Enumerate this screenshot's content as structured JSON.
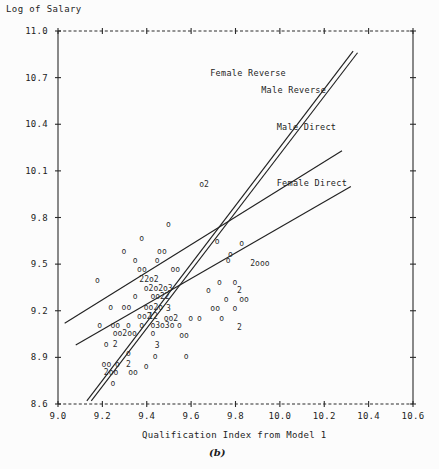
{
  "figure": {
    "panel_label": "(b)",
    "ylabel": "Log of Salary",
    "xlabel": "Qualification Index from Model 1"
  },
  "chart_data": {
    "type": "scatter",
    "title": "",
    "ylabel": "Log of Salary",
    "xlabel": "Qualification Index from Model 1",
    "panel": "(b)",
    "xlim": [
      9.0,
      10.6
    ],
    "ylim": [
      8.6,
      11.0
    ],
    "xticks": [
      "9.0",
      "9.2",
      "9.4",
      "9.6",
      "9.8",
      "10.0",
      "10.2",
      "10.4",
      "10.6"
    ],
    "yticks": [
      "11.0",
      "10.7",
      "10.4",
      "10.1",
      "9.8",
      "9.5",
      "9.2",
      "8.9",
      "8.6"
    ],
    "grid": false,
    "legend_position": "inline-annotations",
    "marker": "o",
    "overplot_notation": "digits indicate number of coincident points",
    "series": [
      {
        "name": "Female Reverse",
        "type": "line",
        "label_x": 9.92,
        "label_y": 10.73,
        "x": [
          9.13,
          10.33
        ],
        "y": [
          8.62,
          10.87
        ]
      },
      {
        "name": "Male Reverse",
        "type": "line",
        "label_x": 10.15,
        "label_y": 10.62,
        "x": [
          9.15,
          10.35
        ],
        "y": [
          8.62,
          10.86
        ]
      },
      {
        "name": "Male Direct",
        "type": "line",
        "label_x": 10.22,
        "label_y": 10.38,
        "x": [
          9.03,
          10.28
        ],
        "y": [
          9.12,
          10.23
        ]
      },
      {
        "name": "Female Direct",
        "type": "line",
        "label_x": 10.22,
        "label_y": 10.02,
        "x": [
          9.08,
          10.32
        ],
        "y": [
          8.98,
          10.0
        ]
      }
    ],
    "scatter_labels": [
      {
        "t": "o2",
        "x": 9.65,
        "y": 10.01
      },
      {
        "t": "o",
        "x": 9.5,
        "y": 9.75
      },
      {
        "t": "o",
        "x": 9.38,
        "y": 9.66
      },
      {
        "t": "o",
        "x": 9.72,
        "y": 9.64
      },
      {
        "t": "o",
        "x": 9.83,
        "y": 9.63
      },
      {
        "t": "o",
        "x": 9.3,
        "y": 9.58
      },
      {
        "t": "oo",
        "x": 9.46,
        "y": 9.58
      },
      {
        "t": "o",
        "x": 9.78,
        "y": 9.56
      },
      {
        "t": "o",
        "x": 9.35,
        "y": 9.52
      },
      {
        "t": "o",
        "x": 9.45,
        "y": 9.52
      },
      {
        "t": "o",
        "x": 9.77,
        "y": 9.52
      },
      {
        "t": "2ooo",
        "x": 9.88,
        "y": 9.5
      },
      {
        "t": "oo",
        "x": 9.37,
        "y": 9.46
      },
      {
        "t": "oo",
        "x": 9.52,
        "y": 9.46
      },
      {
        "t": "22o2",
        "x": 9.38,
        "y": 9.4
      },
      {
        "t": "o",
        "x": 9.18,
        "y": 9.39
      },
      {
        "t": "o",
        "x": 9.73,
        "y": 9.38
      },
      {
        "t": "o",
        "x": 9.8,
        "y": 9.38
      },
      {
        "t": "o2o2o3",
        "x": 9.4,
        "y": 9.34
      },
      {
        "t": "o",
        "x": 9.68,
        "y": 9.33
      },
      {
        "t": "2",
        "x": 9.82,
        "y": 9.33
      },
      {
        "t": "o",
        "x": 9.35,
        "y": 9.29
      },
      {
        "t": "oo22",
        "x": 9.43,
        "y": 9.29
      },
      {
        "t": "o",
        "x": 9.76,
        "y": 9.27
      },
      {
        "t": "oo",
        "x": 9.83,
        "y": 9.27
      },
      {
        "t": "o",
        "x": 9.24,
        "y": 9.22
      },
      {
        "t": "oo",
        "x": 9.3,
        "y": 9.22
      },
      {
        "t": "oo2o",
        "x": 9.4,
        "y": 9.22
      },
      {
        "t": "3",
        "x": 9.5,
        "y": 9.21
      },
      {
        "t": "oo",
        "x": 9.7,
        "y": 9.21
      },
      {
        "t": "o",
        "x": 9.8,
        "y": 9.21
      },
      {
        "t": "oo2",
        "x": 9.37,
        "y": 9.16
      },
      {
        "t": "12",
        "x": 9.42,
        "y": 9.16
      },
      {
        "t": "oo2",
        "x": 9.49,
        "y": 9.15
      },
      {
        "t": "o",
        "x": 9.6,
        "y": 9.15
      },
      {
        "t": "o",
        "x": 9.64,
        "y": 9.15
      },
      {
        "t": "o",
        "x": 9.74,
        "y": 9.15
      },
      {
        "t": "o",
        "x": 9.19,
        "y": 9.1
      },
      {
        "t": "oo",
        "x": 9.25,
        "y": 9.1
      },
      {
        "t": "o",
        "x": 9.32,
        "y": 9.1
      },
      {
        "t": "o",
        "x": 9.38,
        "y": 9.1
      },
      {
        "t": "o3o3o",
        "x": 9.43,
        "y": 9.1
      },
      {
        "t": "o",
        "x": 9.55,
        "y": 9.1
      },
      {
        "t": "2",
        "x": 9.82,
        "y": 9.09
      },
      {
        "t": "oo2oo",
        "x": 9.26,
        "y": 9.05
      },
      {
        "t": "o",
        "x": 9.43,
        "y": 9.05
      },
      {
        "t": "oo",
        "x": 9.56,
        "y": 9.04
      },
      {
        "t": "o",
        "x": 9.22,
        "y": 8.98
      },
      {
        "t": "2",
        "x": 9.26,
        "y": 8.98
      },
      {
        "t": "3",
        "x": 9.45,
        "y": 8.97
      },
      {
        "t": "o",
        "x": 9.32,
        "y": 8.92
      },
      {
        "t": "o",
        "x": 9.44,
        "y": 8.9
      },
      {
        "t": "o",
        "x": 9.58,
        "y": 8.9
      },
      {
        "t": "oo",
        "x": 9.21,
        "y": 8.85
      },
      {
        "t": "o",
        "x": 9.27,
        "y": 8.85
      },
      {
        "t": "2",
        "x": 9.32,
        "y": 8.85
      },
      {
        "t": "o",
        "x": 9.4,
        "y": 8.84
      },
      {
        "t": "2oo",
        "x": 9.22,
        "y": 8.8
      },
      {
        "t": "oo",
        "x": 9.33,
        "y": 8.8
      },
      {
        "t": "o",
        "x": 9.25,
        "y": 8.73
      }
    ]
  }
}
